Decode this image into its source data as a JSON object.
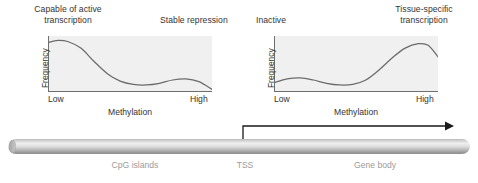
{
  "figure": {
    "callouts": {
      "active": "Capable of active\ntranscription",
      "repression": "Stable repression",
      "inactive": "Inactive",
      "tissue_specific": "Tissue-specific\ntranscription"
    },
    "gene": {
      "regions": [
        {
          "name": "cpg-islands",
          "label": "CpG islands"
        },
        {
          "name": "tss",
          "label": "TSS"
        },
        {
          "name": "gene-body",
          "label": "Gene body"
        }
      ],
      "arrow": "transcription-direction-arrow"
    },
    "colors": {
      "plot_background": "#f0f0f0",
      "curve": "#6b6b6b",
      "axis": "#6e6e6e",
      "text": "#333333",
      "region_label": "#9b9b9b",
      "cylinder_light": "#efefef",
      "cylinder_dark": "#8e8e8e"
    }
  },
  "chart_data": [
    {
      "type": "line",
      "name": "cpg-island-methylation",
      "title": "CpG islands",
      "xlabel": "Methylation",
      "ylabel": "Frequency",
      "xticks": [
        "Low",
        "High"
      ],
      "yticks": [],
      "xlim": [
        0,
        100
      ],
      "ylim": [
        0,
        100
      ],
      "grid": false,
      "legend": "none",
      "annotations": [
        {
          "text": "Capable of active transcription",
          "position": "top-left"
        },
        {
          "text": "Stable repression",
          "position": "top-right"
        }
      ],
      "x": [
        0,
        6,
        12,
        20,
        28,
        36,
        44,
        52,
        60,
        68,
        76,
        84,
        92,
        100
      ],
      "y": [
        88,
        92,
        90,
        78,
        54,
        32,
        18,
        12,
        11,
        14,
        20,
        22,
        17,
        3
      ]
    },
    {
      "type": "line",
      "name": "gene-body-methylation",
      "title": "Gene body",
      "xlabel": "Methylation",
      "ylabel": "Frequency",
      "xticks": [
        "Low",
        "High"
      ],
      "yticks": [],
      "xlim": [
        0,
        100
      ],
      "ylim": [
        0,
        100
      ],
      "grid": false,
      "legend": "none",
      "annotations": [
        {
          "text": "Inactive",
          "position": "top-left"
        },
        {
          "text": "Tissue-specific transcription",
          "position": "top-right"
        }
      ],
      "x": [
        0,
        8,
        16,
        24,
        32,
        40,
        48,
        56,
        64,
        72,
        80,
        88,
        94,
        100
      ],
      "y": [
        15,
        22,
        24,
        20,
        14,
        11,
        12,
        20,
        38,
        60,
        78,
        86,
        83,
        62
      ]
    }
  ]
}
